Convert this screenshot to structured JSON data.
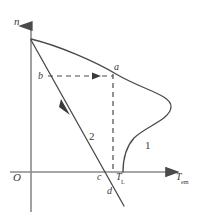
{
  "figure": {
    "stroke_color": "#4a4a4a",
    "label_color": "#3a3a3a",
    "background": "#ffffff",
    "axes": {
      "y_axis_label": "n",
      "origin_label": "O",
      "x_axis_label_base": "T",
      "x_axis_label_sub": "em"
    },
    "points": [
      {
        "id": "a",
        "label": "a"
      },
      {
        "id": "b",
        "label": "b"
      },
      {
        "id": "c",
        "label": "c"
      },
      {
        "id": "d",
        "label": "d"
      }
    ],
    "curves": [
      {
        "id": "curve-1",
        "label": "1",
        "kind": "motor-characteristic"
      },
      {
        "id": "curve-2",
        "label": "2",
        "kind": "load-line"
      }
    ],
    "markers": {
      "load_torque_base": "T",
      "load_torque_sub": "L"
    }
  }
}
